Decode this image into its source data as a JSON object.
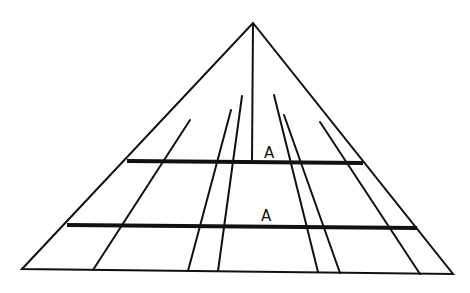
{
  "diagram": {
    "type": "perspective-illusion",
    "stroke_color": "#111111",
    "background": "#ffffff",
    "apex": [
      253,
      23
    ],
    "outline": [
      [
        22,
        269
      ],
      [
        253,
        23
      ],
      [
        453,
        274
      ]
    ],
    "base": [
      [
        22,
        269
      ],
      [
        453,
        274
      ]
    ],
    "center_line": [
      [
        253,
        23
      ],
      [
        252,
        162
      ]
    ],
    "converging_lines": [
      {
        "from": [
          190,
          120
        ],
        "to": [
          93,
          270
        ]
      },
      {
        "from": [
          231,
          110
        ],
        "to": [
          188,
          271
        ]
      },
      {
        "from": [
          242,
          96
        ],
        "to": [
          218,
          271
        ]
      },
      {
        "from": [
          274,
          95
        ],
        "to": [
          318,
          272
        ]
      },
      {
        "from": [
          284,
          115
        ],
        "to": [
          340,
          273
        ]
      },
      {
        "from": [
          320,
          122
        ],
        "to": [
          420,
          274
        ]
      }
    ],
    "bars": [
      {
        "name": "upper-bar",
        "from": [
          127,
          161
        ],
        "to": [
          363,
          163
        ],
        "label": "A",
        "label_pos": [
          264,
          146
        ]
      },
      {
        "name": "lower-bar",
        "from": [
          67,
          225
        ],
        "to": [
          417,
          228
        ],
        "label": "A",
        "label_pos": [
          261,
          209
        ]
      }
    ]
  }
}
